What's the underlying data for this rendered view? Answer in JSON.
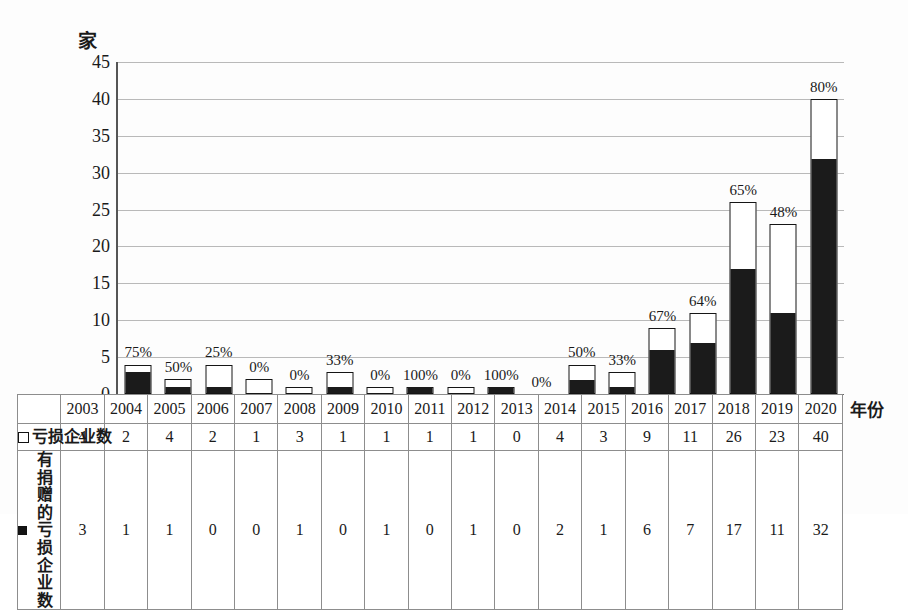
{
  "chart_data": {
    "type": "bar",
    "subtype": "stacked-vertical",
    "title": "",
    "xlabel": "年份",
    "ylabel": "家",
    "ylim": [
      0,
      45
    ],
    "yticks": [
      0,
      5,
      10,
      15,
      20,
      25,
      30,
      35,
      40,
      45
    ],
    "grid": true,
    "legend_position": "bottom-table",
    "categories": [
      "2003",
      "2004",
      "2005",
      "2006",
      "2007",
      "2008",
      "2009",
      "2010",
      "2011",
      "2012",
      "2013",
      "2014",
      "2015",
      "2016",
      "2017",
      "2018",
      "2019",
      "2020"
    ],
    "series": [
      {
        "name": "亏损企业数",
        "style": "hollow",
        "values": [
          4,
          2,
          4,
          2,
          1,
          3,
          1,
          1,
          1,
          1,
          0,
          4,
          3,
          9,
          11,
          26,
          23,
          40
        ]
      },
      {
        "name": "有捐赠的亏损企业数",
        "style": "solid",
        "values": [
          3,
          1,
          1,
          0,
          0,
          1,
          0,
          1,
          0,
          1,
          0,
          2,
          1,
          6,
          7,
          17,
          11,
          32
        ]
      }
    ],
    "annotations": {
      "label": "percent of loss-making enterprises that donated",
      "values": [
        "75%",
        "50%",
        "25%",
        "0%",
        "0%",
        "33%",
        "0%",
        "100%",
        "0%",
        "100%",
        "0%",
        "50%",
        "33%",
        "67%",
        "64%",
        "65%",
        "48%",
        "80%"
      ]
    },
    "colors": {
      "solid_fill": "#1b1b1b",
      "hollow_fill": "#ffffff",
      "bar_border": "#151515",
      "gridline": "#b9b9b9",
      "axis": "#555555"
    }
  },
  "axis": {
    "y_unit": "家",
    "x_caption": "年份",
    "yticks": [
      "45",
      "40",
      "35",
      "30",
      "25",
      "20",
      "15",
      "10",
      "5",
      "0"
    ]
  },
  "table": {
    "year_row": [
      "2003",
      "2004",
      "2005",
      "2006",
      "2007",
      "2008",
      "2009",
      "2010",
      "2011",
      "2012",
      "2013",
      "2014",
      "2015",
      "2016",
      "2017",
      "2018",
      "2019",
      "2020"
    ],
    "rows": [
      {
        "legend_symbol": "hollow-square",
        "label": "亏损企业数",
        "values": [
          "4",
          "2",
          "4",
          "2",
          "1",
          "3",
          "1",
          "1",
          "1",
          "1",
          "0",
          "4",
          "3",
          "9",
          "11",
          "26",
          "23",
          "40"
        ]
      },
      {
        "legend_symbol": "solid-square",
        "label": "有捐赠的亏损企业数",
        "values": [
          "3",
          "1",
          "1",
          "0",
          "0",
          "1",
          "0",
          "1",
          "0",
          "1",
          "0",
          "2",
          "1",
          "6",
          "7",
          "17",
          "11",
          "32"
        ]
      }
    ]
  }
}
